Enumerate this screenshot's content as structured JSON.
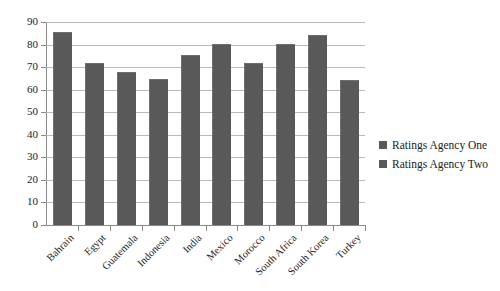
{
  "chart_data": {
    "type": "bar",
    "title": "",
    "subtitle": "",
    "xlabel": "",
    "ylabel": "",
    "ylim": [
      0,
      90
    ],
    "ytick_step": 10,
    "yticks": [
      0,
      10,
      20,
      30,
      40,
      50,
      60,
      70,
      80,
      90
    ],
    "grid": true,
    "legend_position": "right",
    "categories": [
      "Bahrain",
      "Egypt",
      "Guatemala",
      "Indonesia",
      "India",
      "Mexico",
      "Morocco",
      "South Africa",
      "South Korea",
      "Turkey"
    ],
    "series": [
      {
        "name": "Ratings Agency One",
        "color": "#595959",
        "values": [
          85,
          71.5,
          67.5,
          64.5,
          75,
          80,
          71.5,
          80,
          84,
          64
        ]
      },
      {
        "name": "Ratings Agency Two",
        "color": "#595959",
        "values": [
          85,
          71.5,
          67.5,
          64.5,
          75,
          80,
          71.5,
          80,
          84,
          64
        ]
      }
    ],
    "values": [
      85,
      71.5,
      67.5,
      64.5,
      75,
      80,
      71.5,
      80,
      84,
      64
    ],
    "bar_color": "#595959"
  },
  "legend": {
    "items": [
      {
        "label": "Ratings Agency One",
        "color": "#595959"
      },
      {
        "label": "Ratings Agency Two",
        "color": "#595959"
      }
    ]
  }
}
